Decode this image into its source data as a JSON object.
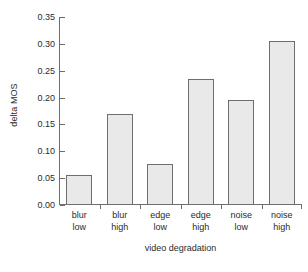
{
  "chart_data": {
    "type": "bar",
    "title": "",
    "xlabel": "video degradation",
    "ylabel": "delta MOS",
    "categories": [
      "blur low",
      "blur high",
      "edge low",
      "edge high",
      "noise low",
      "noise high"
    ],
    "category_lines": [
      [
        "blur",
        "low"
      ],
      [
        "blur",
        "high"
      ],
      [
        "edge",
        "low"
      ],
      [
        "edge",
        "high"
      ],
      [
        "noise",
        "low"
      ],
      [
        "noise",
        "high"
      ]
    ],
    "values": [
      0.054,
      0.168,
      0.074,
      0.233,
      0.194,
      0.303
    ],
    "ylim": [
      0.0,
      0.35
    ],
    "yticks": [
      0.0,
      0.05,
      0.1,
      0.15,
      0.2,
      0.25,
      0.3,
      0.35
    ],
    "ytick_labels": [
      "0.00",
      "0.05",
      "0.10",
      "0.15",
      "0.20",
      "0.25",
      "0.30",
      "0.35"
    ],
    "grid": false,
    "legend": null,
    "bar_fill_color": "#e9e9e9",
    "bar_edge_color": "#6e6e6e",
    "axis_color": "#6e6e6e",
    "text_color": "#2b2b2b",
    "background_color": "#ffffff"
  }
}
